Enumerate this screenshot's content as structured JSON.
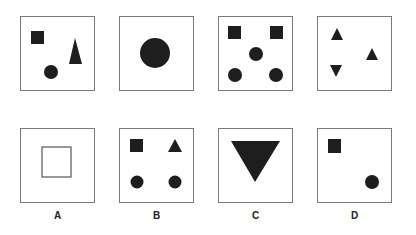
{
  "puzzle": {
    "shape_color": "#1e1e1e",
    "border_color": "#7a7a7a",
    "sequence": [
      {
        "id": "seq-1",
        "box": {
          "x": 20,
          "y": 16
        },
        "shapes": [
          {
            "type": "square",
            "x": 11,
            "y": 15,
            "w": 13,
            "h": 13
          },
          {
            "type": "circle",
            "cx": 31,
            "cy": 56,
            "r": 7
          },
          {
            "type": "triangle",
            "points": "55,22 49,48 62,48"
          }
        ]
      },
      {
        "id": "seq-2",
        "box": {
          "x": 119,
          "y": 16
        },
        "shapes": [
          {
            "type": "circle",
            "cx": 36,
            "cy": 37,
            "r": 15
          }
        ]
      },
      {
        "id": "seq-3",
        "box": {
          "x": 218,
          "y": 16
        },
        "shapes": [
          {
            "type": "square",
            "x": 10,
            "y": 10,
            "w": 13,
            "h": 13
          },
          {
            "type": "square",
            "x": 52,
            "y": 10,
            "w": 13,
            "h": 13
          },
          {
            "type": "circle",
            "cx": 38,
            "cy": 38,
            "r": 7
          },
          {
            "type": "circle",
            "cx": 17,
            "cy": 59,
            "r": 7
          },
          {
            "type": "circle",
            "cx": 58,
            "cy": 59,
            "r": 7
          }
        ]
      },
      {
        "id": "seq-4",
        "box": {
          "x": 317,
          "y": 16
        },
        "shapes": [
          {
            "type": "triangle",
            "points": "20,12 14,24 26,24"
          },
          {
            "type": "triangle",
            "points": "55,32 49,44 61,44"
          },
          {
            "type": "triangle",
            "points": "13,49 25,49 19,61"
          }
        ]
      }
    ],
    "options": [
      {
        "id": "option-a",
        "label": "A",
        "box": {
          "x": 20,
          "y": 128
        },
        "shapes": [
          {
            "type": "hollow-square",
            "x": 22,
            "y": 19,
            "w": 29,
            "h": 30
          }
        ]
      },
      {
        "id": "option-b",
        "label": "B",
        "box": {
          "x": 119,
          "y": 128
        },
        "shapes": [
          {
            "type": "square",
            "x": 11,
            "y": 11,
            "w": 13,
            "h": 13
          },
          {
            "type": "triangle",
            "points": "56,11 49,24 63,24"
          },
          {
            "type": "circle",
            "cx": 18,
            "cy": 54,
            "r": 6.5
          },
          {
            "type": "circle",
            "cx": 56,
            "cy": 54,
            "r": 6.5
          }
        ]
      },
      {
        "id": "option-c",
        "label": "C",
        "box": {
          "x": 218,
          "y": 128
        },
        "shapes": [
          {
            "type": "triangle",
            "points": "13,13 62,13 37,54"
          }
        ]
      },
      {
        "id": "option-d",
        "label": "D",
        "box": {
          "x": 317,
          "y": 128
        },
        "shapes": [
          {
            "type": "square",
            "x": 11,
            "y": 11,
            "w": 13,
            "h": 14
          },
          {
            "type": "circle",
            "cx": 55,
            "cy": 54,
            "r": 7
          }
        ]
      }
    ]
  }
}
